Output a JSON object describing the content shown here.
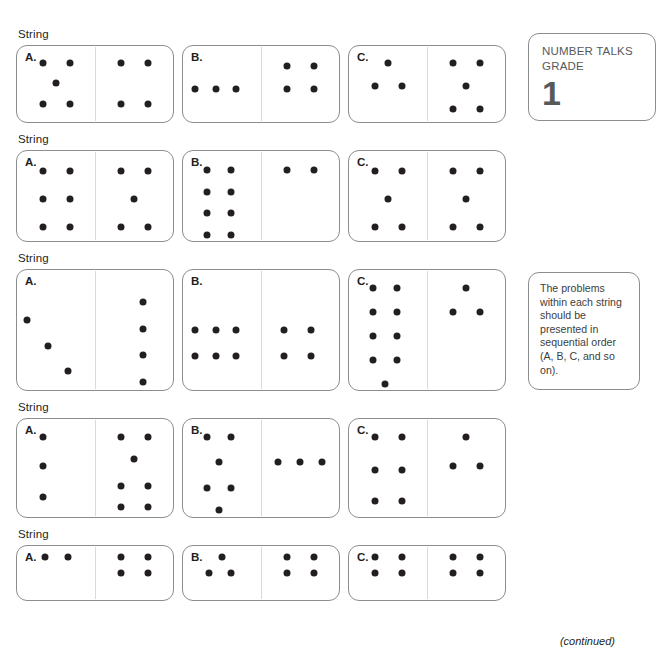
{
  "sidebar": {
    "badge": {
      "title": "NUMBER TALKS\nGRADE",
      "grade": "1"
    },
    "note": {
      "text": "The problems within each string should be presented in sequential order (A, B, C, and so on)."
    }
  },
  "footer": {
    "continued": "(continued)"
  },
  "strings": [
    {
      "label": "String",
      "height": 78,
      "cards": [
        {
          "letter": "A.",
          "left": [
            [
              33,
              22
            ],
            [
              68,
              22
            ],
            [
              50,
              49
            ],
            [
              33,
              76
            ],
            [
              68,
              76
            ]
          ],
          "right": [
            [
              33,
              22
            ],
            [
              68,
              22
            ],
            [
              33,
              76
            ],
            [
              68,
              76
            ]
          ]
        },
        {
          "letter": "B.",
          "left": [
            [
              16,
              56
            ],
            [
              42,
              56
            ],
            [
              68,
              56
            ]
          ],
          "right": [
            [
              33,
              26
            ],
            [
              68,
              26
            ],
            [
              33,
              56
            ],
            [
              68,
              56
            ]
          ]
        },
        {
          "letter": "C.",
          "left": [
            [
              50,
              22
            ],
            [
              33,
              53
            ],
            [
              68,
              53
            ]
          ],
          "right": [
            [
              33,
              22
            ],
            [
              68,
              22
            ],
            [
              50,
              53
            ],
            [
              33,
              83
            ],
            [
              68,
              83
            ]
          ]
        }
      ]
    },
    {
      "label": "String",
      "height": 92,
      "cards": [
        {
          "letter": "A.",
          "left": [
            [
              33,
              22
            ],
            [
              68,
              22
            ],
            [
              33,
              53
            ],
            [
              68,
              53
            ],
            [
              33,
              84
            ],
            [
              68,
              84
            ]
          ],
          "right": [
            [
              33,
              22
            ],
            [
              68,
              22
            ],
            [
              50,
              53
            ],
            [
              33,
              84
            ],
            [
              68,
              84
            ]
          ]
        },
        {
          "letter": "B.",
          "left": [
            [
              31,
              21
            ],
            [
              62,
              21
            ],
            [
              31,
              45
            ],
            [
              62,
              45
            ],
            [
              31,
              69
            ],
            [
              62,
              69
            ],
            [
              31,
              93
            ],
            [
              62,
              93
            ]
          ],
          "right": [
            [
              33,
              21
            ],
            [
              68,
              21
            ]
          ]
        },
        {
          "letter": "C.",
          "left": [
            [
              33,
              22
            ],
            [
              68,
              22
            ],
            [
              50,
              53
            ],
            [
              33,
              84
            ],
            [
              68,
              84
            ]
          ],
          "right": [
            [
              33,
              22
            ],
            [
              68,
              22
            ],
            [
              50,
              53
            ],
            [
              33,
              84
            ],
            [
              68,
              84
            ]
          ]
        }
      ]
    },
    {
      "label": "String",
      "height": 122,
      "cards": [
        {
          "letter": "A.",
          "left": [
            [
              13,
              42
            ],
            [
              40,
              63
            ],
            [
              66,
              84
            ]
          ],
          "right": [
            [
              62,
              27
            ],
            [
              62,
              49
            ],
            [
              62,
              71
            ],
            [
              62,
              93
            ]
          ],
          "tall": true
        },
        {
          "letter": "B.",
          "left": [
            [
              16,
              50
            ],
            [
              42,
              50
            ],
            [
              68,
              50
            ],
            [
              16,
              72
            ],
            [
              42,
              72
            ],
            [
              68,
              72
            ]
          ],
          "right": [
            [
              30,
              50
            ],
            [
              64,
              50
            ],
            [
              30,
              72
            ],
            [
              64,
              72
            ]
          ],
          "tall": true
        },
        {
          "letter": "C.",
          "left": [
            [
              31,
              15
            ],
            [
              62,
              15
            ],
            [
              31,
              35
            ],
            [
              62,
              35
            ],
            [
              31,
              55
            ],
            [
              62,
              55
            ],
            [
              31,
              75
            ],
            [
              62,
              75
            ],
            [
              46,
              95
            ]
          ],
          "right": [
            [
              50,
              15
            ],
            [
              33,
              35
            ],
            [
              68,
              35
            ]
          ],
          "tall": true
        }
      ]
    },
    {
      "label": "String",
      "height": 100,
      "cards": [
        {
          "letter": "A.",
          "left": [
            [
              33,
              18
            ],
            [
              33,
              48
            ],
            [
              33,
              80
            ]
          ],
          "right": [
            [
              33,
              18
            ],
            [
              68,
              18
            ],
            [
              50,
              41
            ],
            [
              33,
              68
            ],
            [
              68,
              68
            ],
            [
              33,
              90
            ],
            [
              68,
              90
            ]
          ]
        },
        {
          "letter": "B.",
          "left": [
            [
              31,
              18
            ],
            [
              62,
              18
            ],
            [
              46,
              44
            ],
            [
              31,
              70
            ],
            [
              62,
              70
            ],
            [
              46,
              93
            ]
          ],
          "right": [
            [
              22,
              44
            ],
            [
              50,
              44
            ],
            [
              78,
              44
            ]
          ]
        },
        {
          "letter": "C.",
          "left": [
            [
              33,
              18
            ],
            [
              68,
              18
            ],
            [
              33,
              52
            ],
            [
              68,
              52
            ],
            [
              33,
              84
            ],
            [
              68,
              84
            ]
          ],
          "right": [
            [
              50,
              18
            ],
            [
              33,
              48
            ],
            [
              68,
              48
            ]
          ]
        }
      ]
    },
    {
      "label": "String",
      "height": 56,
      "cards": [
        {
          "letter": "A.",
          "left": [
            [
              36,
              20
            ],
            [
              66,
              20
            ]
          ],
          "right": [
            [
              33,
              20
            ],
            [
              68,
              20
            ],
            [
              33,
              50
            ],
            [
              68,
              50
            ]
          ]
        },
        {
          "letter": "B.",
          "left": [
            [
              50,
              20
            ],
            [
              33,
              50
            ],
            [
              62,
              50
            ]
          ],
          "right": [
            [
              33,
              20
            ],
            [
              68,
              20
            ],
            [
              33,
              50
            ],
            [
              68,
              50
            ]
          ]
        },
        {
          "letter": "C.",
          "left": [
            [
              33,
              20
            ],
            [
              68,
              20
            ],
            [
              33,
              50
            ],
            [
              68,
              50
            ]
          ],
          "right": [
            [
              33,
              20
            ],
            [
              68,
              20
            ],
            [
              33,
              50
            ],
            [
              68,
              50
            ]
          ]
        }
      ]
    }
  ]
}
